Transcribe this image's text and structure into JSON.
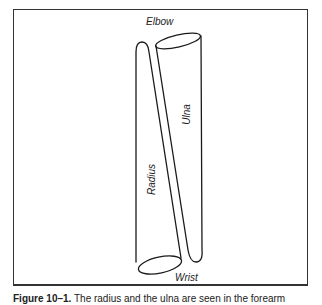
{
  "figure": {
    "labels": {
      "top": "Elbow",
      "bottom": "Wrist",
      "left_bone": "Radius",
      "right_bone": "Ulna"
    },
    "caption": {
      "number": "Figure 10–1.",
      "text": " The radius and the ulna are seen in the forearm"
    },
    "colors": {
      "stroke": "#1a1a1a",
      "frame": "#333333",
      "background": "#ffffff"
    }
  }
}
